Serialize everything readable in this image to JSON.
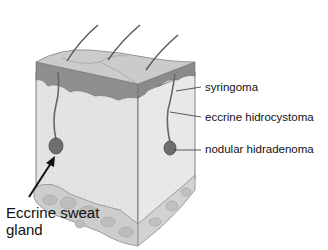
{
  "figure": {
    "labels": {
      "syringoma": "syringoma",
      "eccrine_hidrocystoma": "eccrine hidrocystoma",
      "nodular_hidradenoma": "nodular hidradenoma",
      "eccrine_sweat_gland_line1": "Eccrine sweat",
      "eccrine_sweat_gland_line2": "gland"
    },
    "colors": {
      "epidermis_top": "#c8c8c8",
      "epidermis_band": "#8c8c8c",
      "dermis": "#e2e2e2",
      "subcutis": "#cfcfcf",
      "gland": "#6a6a6a",
      "outline": "#555555",
      "text": "#111111"
    }
  }
}
